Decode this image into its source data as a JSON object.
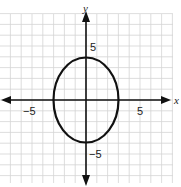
{
  "chart_data": {
    "type": "line",
    "title": "",
    "xlabel": "x",
    "ylabel": "y",
    "xlim": [
      -8,
      8
    ],
    "ylim": [
      -8,
      9
    ],
    "grid": true,
    "tick_labels": {
      "x": [
        {
          "value": -5,
          "label": "−5"
        },
        {
          "value": 5,
          "label": "5"
        }
      ],
      "y": [
        {
          "value": 5,
          "label": "5"
        },
        {
          "value": -5,
          "label": "−5"
        }
      ]
    },
    "series": [
      {
        "name": "ellipse",
        "shape": "ellipse",
        "center": [
          0,
          0
        ],
        "semi_axis_x": 3,
        "semi_axis_y": 4,
        "equation": "x^2/9 + y^2/16 = 1",
        "color": "#111111"
      }
    ]
  },
  "labels": {
    "x_axis": "x",
    "y_axis": "y",
    "x_neg5": "−5",
    "x_pos5": "5",
    "y_pos5": "5",
    "y_neg5": "−5"
  },
  "colors": {
    "grid": "#d4d4d4",
    "axis": "#111111",
    "curve": "#111111",
    "background": "#ffffff"
  }
}
